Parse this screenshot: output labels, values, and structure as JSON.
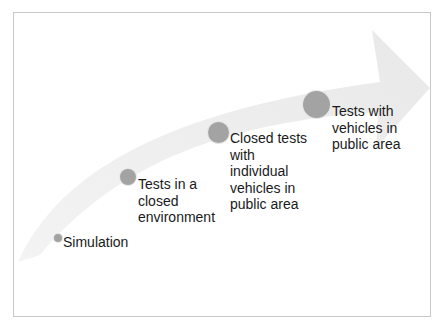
{
  "diagram": {
    "type": "progression-arrow",
    "stages": [
      {
        "label_lines": [
          "Simulation"
        ]
      },
      {
        "label_lines": [
          "Tests in a",
          "closed",
          "environment"
        ]
      },
      {
        "label_lines": [
          "Closed tests",
          "with",
          "individual",
          "vehicles in",
          "public area"
        ]
      },
      {
        "label_lines": [
          "Tests with",
          "vehicles in",
          "public area"
        ]
      }
    ],
    "colors": {
      "dot": "#a3a3a3",
      "arrow": "#ebebeb",
      "text": "#1a1a1a",
      "border": "#c8c8c8"
    }
  }
}
